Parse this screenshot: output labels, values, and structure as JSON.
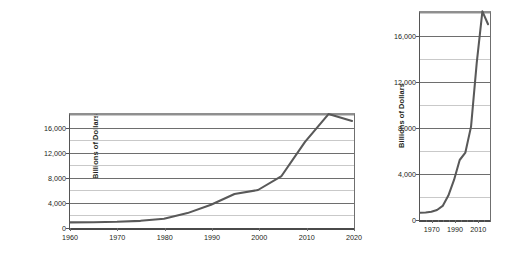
{
  "chart_data": [
    {
      "id": "wide",
      "type": "line",
      "title": "",
      "xlabel": "",
      "ylabel": "Billions of Dollars",
      "x": [
        1960,
        1965,
        1970,
        1975,
        1980,
        1985,
        1990,
        1995,
        2000,
        2005,
        2010,
        2015,
        2020
      ],
      "values": [
        290,
        320,
        380,
        540,
        900,
        1820,
        3200,
        4970,
        5630,
        7930,
        13560,
        18150,
        17000
      ],
      "xlim": [
        1960,
        2020
      ],
      "ylim": [
        0,
        18000
      ],
      "xticks": [
        1960,
        1970,
        1980,
        1990,
        2000,
        2010,
        2020
      ],
      "xticklabels": [
        "1960",
        "1970",
        "1980",
        "1990",
        "2000",
        "2010",
        "2020"
      ],
      "yticks": [
        0,
        4000,
        8000,
        12000,
        16000
      ],
      "yticklabels": [
        "0",
        "4,000",
        "8,000",
        "12,000",
        "16,000"
      ],
      "minor_yticks": [
        2000,
        6000,
        10000,
        14000,
        18000
      ],
      "grid": true,
      "legend": "none",
      "line_color": "#595959"
    },
    {
      "id": "tall",
      "type": "line",
      "title": "",
      "xlabel": "",
      "ylabel": "Billions of Dollars",
      "x": [
        1960,
        1965,
        1970,
        1975,
        1980,
        1985,
        1990,
        1995,
        2000,
        2005,
        2010,
        2015,
        2020
      ],
      "values": [
        290,
        320,
        380,
        540,
        900,
        1820,
        3200,
        4970,
        5630,
        7930,
        13560,
        18150,
        17000
      ],
      "xlim": [
        1960,
        2020
      ],
      "ylim": [
        0,
        18000
      ],
      "xticks": [
        1970,
        1990,
        2010
      ],
      "xticklabels": [
        "1970",
        "1990",
        "2010"
      ],
      "minor_xticks": [
        1965,
        1975,
        1980,
        1985,
        1995,
        2000,
        2005,
        2015,
        2020
      ],
      "yticks": [
        0,
        4000,
        8000,
        12000,
        16000
      ],
      "yticklabels": [
        "0",
        "4,000",
        "8,000",
        "12,000",
        "16,000"
      ],
      "minor_yticks": [
        2000,
        6000,
        10000,
        14000,
        18000
      ],
      "grid": true,
      "legend": "none",
      "line_color": "#595959"
    }
  ],
  "colors": {
    "line": "#595959",
    "gridline_major": "#6e6e6e",
    "gridline_minor": "#c9c9c9",
    "axis": "#4a4a4a",
    "text": "#231f20",
    "background": "#ffffff"
  }
}
